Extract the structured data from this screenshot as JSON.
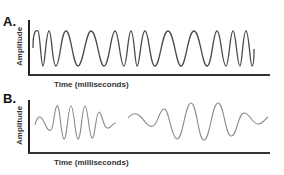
{
  "panels": [
    {
      "label": "A.",
      "ylabel": "Amplitude",
      "xlabel": "Time (milliseconds)",
      "description": "Continuous constant-amplitude sinusoid with varying frequency (frequency modulated)"
    },
    {
      "label": "B.",
      "ylabel": "Amplitude",
      "xlabel": "Time (milliseconds)",
      "description": "Two amplitude-modulated wave packets (bursts) with rising and falling amplitude"
    }
  ],
  "colors": {
    "wave_a": "#4a4a4a",
    "wave_b": "#8a8a8a",
    "axis": "#222222",
    "text": "#333333"
  }
}
